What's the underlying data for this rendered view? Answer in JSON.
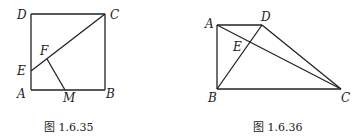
{
  "figures": [
    {
      "caption": "图 1.6.35",
      "labels": {
        "D": "D",
        "C": "C",
        "F": "F",
        "E": "E",
        "A": "A",
        "M": "M",
        "B": "B"
      },
      "description": "Square ABCD with segment EC, E on AD; F on EC, FM drawn to M on AB"
    },
    {
      "caption": "图 1.6.36",
      "labels": {
        "A": "A",
        "D": "D",
        "E": "E",
        "B": "B",
        "C": "C"
      },
      "description": "Trapezoid ABCD with AD ∥ BC, AB ⊥ BC; diagonals AC and BD intersect at E"
    }
  ]
}
